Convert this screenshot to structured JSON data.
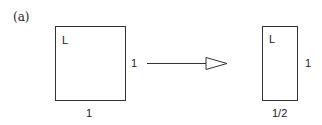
{
  "panel_label": "(a)",
  "left_shape": {
    "corner_label": "L",
    "side_label": "1",
    "bottom_label": "1"
  },
  "right_shape": {
    "corner_label": "L",
    "side_label": "1",
    "bottom_label": "1/2"
  },
  "arrow": {
    "direction": "right"
  }
}
